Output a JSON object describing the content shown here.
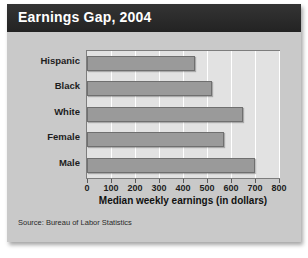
{
  "card": {
    "title": "Earnings Gap, 2004",
    "source": "Source: Bureau of Labor Statistics"
  },
  "chart_data": {
    "type": "bar",
    "orientation": "horizontal",
    "title": "Earnings Gap, 2004",
    "categories": [
      "Hispanic",
      "Black",
      "White",
      "Female",
      "Male"
    ],
    "values": [
      450,
      520,
      650,
      570,
      700
    ],
    "xlabel": "Median weekly earnings (in dollars)",
    "ylabel": "",
    "xlim": [
      0,
      800
    ],
    "xticks": [
      0,
      100,
      200,
      300,
      400,
      500,
      600,
      700,
      800
    ],
    "xtick_labels": [
      "0",
      "100",
      "200",
      "300",
      "400",
      "500",
      "600",
      "700",
      "800"
    ],
    "grid": true,
    "grid_axis": "x",
    "legend": null,
    "bar_color": "#9a9a9a",
    "plot_background": "#e2e2e2",
    "panel_background": "#c9c9c9",
    "title_background": "#2b2b2b",
    "title_color": "#ffffff",
    "source_note": "Source: Bureau of Labor Statistics"
  }
}
